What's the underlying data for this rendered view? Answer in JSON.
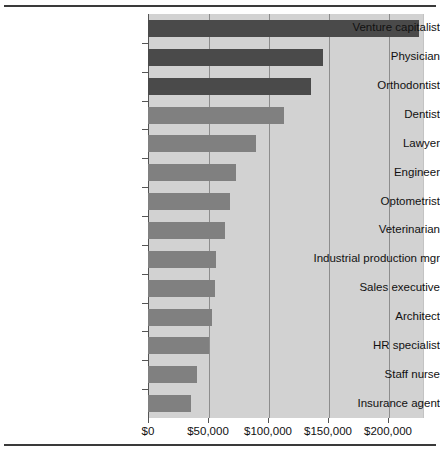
{
  "chart_data": {
    "type": "bar",
    "orientation": "horizontal",
    "title": "",
    "subtitle": "",
    "xlabel": "",
    "ylabel": "",
    "xlim": [
      0,
      230000
    ],
    "grid": true,
    "legend": false,
    "xticks": [
      0,
      50000,
      100000,
      150000,
      200000
    ],
    "xtick_labels": [
      "$0",
      "$50,000",
      "$100,000",
      "$150,000",
      "$200,000"
    ],
    "categories": [
      "Venture capitalist",
      "Physician",
      "Orthodontist",
      "Dentist",
      "Lawyer",
      "Engineer",
      "Optometrist",
      "Veterinarian",
      "Industrial production mgr",
      "Sales executive",
      "Architect",
      "HR specialist",
      "Staff nurse",
      "Insurance agent"
    ],
    "values": [
      226000,
      146000,
      136000,
      113000,
      90000,
      73000,
      68000,
      64000,
      57000,
      56000,
      53000,
      51000,
      41000,
      36000
    ],
    "bar_colors": [
      "#4a4a4a",
      "#4a4a4a",
      "#4a4a4a",
      "#808080",
      "#808080",
      "#808080",
      "#808080",
      "#808080",
      "#808080",
      "#808080",
      "#808080",
      "#808080",
      "#808080",
      "#808080"
    ]
  },
  "style": {
    "plot_background": "#d2d2d2",
    "gridline_color": "#8d8d8d",
    "axis_color": "#555555",
    "text_color": "#111111",
    "dark_bar": "#4a4a4a",
    "light_bar": "#808080"
  }
}
